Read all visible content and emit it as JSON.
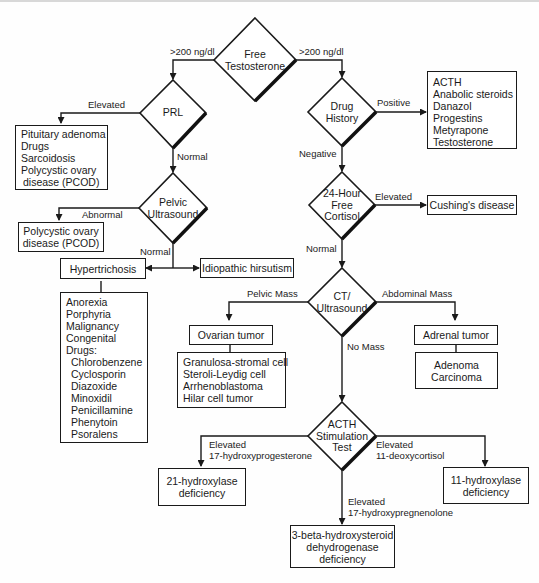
{
  "diagram": {
    "type": "flowchart",
    "topic": "Evaluation of hirsutism",
    "decisions": {
      "free_testosterone": [
        "Free",
        "Testosterone"
      ],
      "prl": [
        "PRL"
      ],
      "drug_history": [
        "Drug",
        "History"
      ],
      "pelvic_ultrasound": [
        "Pelvic",
        "Ultrasound"
      ],
      "free_cortisol": [
        "24-Hour",
        "Free",
        "Cortisol"
      ],
      "ct_ultrasound": [
        "CT/",
        "Ultrasound"
      ],
      "acth_stimulation": [
        "ACTH",
        "Stimulation",
        "Test"
      ]
    },
    "edges": {
      "ft_left": ">200 ng/dl",
      "ft_right": ">200 ng/dl",
      "prl_elevated": "Elevated",
      "prl_normal": "Normal",
      "drug_positive": "Positive",
      "drug_negative": "Negative",
      "pelvic_abnormal": "Abnormal",
      "pelvic_normal": "Normal",
      "cortisol_elevated": "Elevated",
      "cortisol_normal": "Normal",
      "ct_pelvic": "Pelvic Mass",
      "ct_abdominal": "Abdominal Mass",
      "ct_nomass": "No Mass",
      "acth_left": [
        "Elevated",
        "17-hydroxyprogesterone"
      ],
      "acth_right": [
        "Elevated",
        "11-deoxycortisol"
      ],
      "acth_down": [
        "Elevated",
        "17-hydroxypregnenolone"
      ]
    },
    "boxes": {
      "prl_causes": [
        "Pituitary adenoma",
        "Drugs",
        "Sarcoidosis",
        "Polycystic ovary",
        " disease (PCOD)"
      ],
      "drugs": [
        "ACTH",
        "Anabolic steroids",
        "Danazol",
        "Progestins",
        "Metyrapone",
        "Testosterone"
      ],
      "pcod": [
        "Polycystic ovary",
        "disease (PCOD)"
      ],
      "cushings": [
        "Cushing's disease"
      ],
      "hypertrichosis": [
        "Hypertrichosis"
      ],
      "idiopathic": [
        "Idiopathic hirsutism"
      ],
      "hypertrichosis_causes": [
        "Anorexia",
        "Porphyria",
        "Malignancy",
        "Congenital",
        "Drugs:"
      ],
      "hypertrichosis_drugs": [
        "Chlorobenzene",
        "Cyclosporin",
        "Diazoxide",
        "Minoxidil",
        "Penicillamine",
        "Phenytoin",
        "Psoralens"
      ],
      "ovarian_tumor": [
        "Ovarian tumor"
      ],
      "ovarian_types": [
        "Granulosa-stromal cell",
        "Steroli-Leydig cell",
        "Arrhenoblastoma",
        "Hilar cell tumor"
      ],
      "adrenal_tumor": [
        "Adrenal tumor"
      ],
      "adrenal_types": [
        "Adenoma",
        "Carcinoma"
      ],
      "hydroxylase21": [
        "21-hydroxylase",
        "deficiency"
      ],
      "hydroxylase11": [
        "11-hydroxylase",
        "deficiency"
      ],
      "hsd3b": [
        "3-beta-hydroxysteroid",
        "dehydrogenase",
        "deficiency"
      ]
    },
    "colors": {
      "line": "#1a1a1a",
      "background": "#fefefe",
      "shadow": "#111111"
    }
  }
}
